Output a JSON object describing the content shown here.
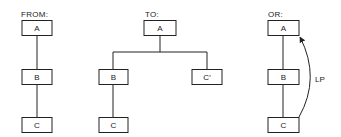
{
  "panels": [
    {
      "id": "from",
      "label": "FROM:",
      "nodes": [
        {
          "id": "A",
          "text": "A"
        },
        {
          "id": "B",
          "text": "B"
        },
        {
          "id": "C",
          "text": "C"
        }
      ],
      "edges": [
        [
          "A",
          "B"
        ],
        [
          "B",
          "C"
        ]
      ]
    },
    {
      "id": "to",
      "label": "TO:",
      "nodes": [
        {
          "id": "A",
          "text": "A"
        },
        {
          "id": "B",
          "text": "B"
        },
        {
          "id": "C",
          "text": "C"
        },
        {
          "id": "C_prime",
          "text": "C′"
        }
      ],
      "edges": [
        [
          "A",
          "B"
        ],
        [
          "A",
          "C_prime"
        ],
        [
          "B",
          "C"
        ]
      ]
    },
    {
      "id": "or",
      "label": "OR:",
      "nodes": [
        {
          "id": "A",
          "text": "A"
        },
        {
          "id": "B",
          "text": "B"
        },
        {
          "id": "C",
          "text": "C"
        }
      ],
      "edges": [
        [
          "A",
          "B"
        ],
        [
          "B",
          "C"
        ]
      ],
      "arrows": [
        {
          "from": "C",
          "to": "A",
          "label": "LP"
        }
      ]
    }
  ],
  "colors": {
    "line": "#222222",
    "background": "#ffffff"
  }
}
